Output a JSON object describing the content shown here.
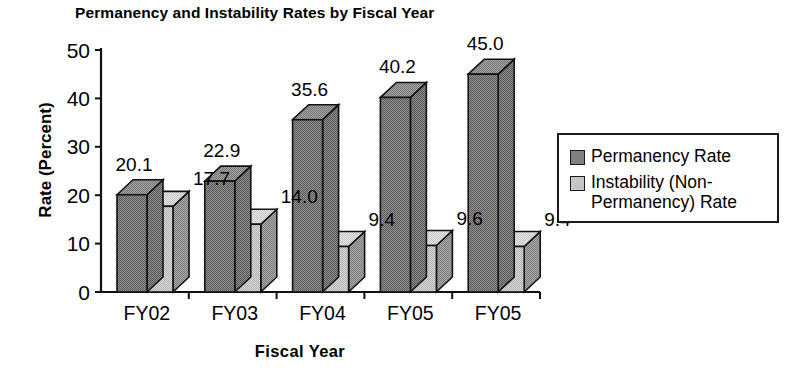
{
  "chart_data": {
    "type": "bar",
    "title": "Permanency and Instability Rates by Fiscal Year",
    "xlabel": "Fiscal  Year",
    "ylabel": "Rate (Percent)",
    "categories": [
      "FY02",
      "FY03",
      "FY04",
      "FY05",
      "FY05"
    ],
    "series": [
      {
        "name": "Permanency Rate",
        "color": "#808080",
        "values": [
          20.1,
          22.9,
          35.6,
          40.2,
          45.0
        ],
        "labels": [
          "20.1",
          "22.9",
          "35.6",
          "40.2",
          "45.0"
        ]
      },
      {
        "name": "Instability (Non-Permanency) Rate",
        "color": "#c6c6c6",
        "values": [
          17.7,
          14.0,
          9.4,
          9.6,
          9.4
        ],
        "labels": [
          "17.7",
          "14.0",
          "9.4",
          "9.6",
          "9.4"
        ]
      }
    ],
    "ylim": [
      0,
      50
    ],
    "yticks": [
      0,
      10,
      20,
      30,
      40,
      50
    ],
    "ytick_labels": [
      "0",
      "10",
      "20",
      "30",
      "40",
      "50"
    ],
    "grid": false,
    "legend_position": "right",
    "three_d": true
  },
  "legend": {
    "entries": [
      {
        "label": "Permanency Rate",
        "color": "#808080"
      },
      {
        "label": "Instability (Non-\nPermanency) Rate",
        "color": "#c6c6c6"
      }
    ]
  }
}
